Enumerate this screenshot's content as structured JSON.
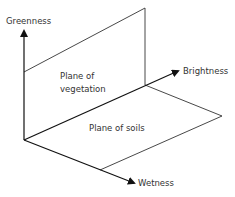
{
  "diagram": {
    "type": "tasseled-cap-3d-axes",
    "axes": {
      "greenness": "Greenness",
      "brightness": "Brightness",
      "wetness": "Wetness"
    },
    "planes": {
      "vegetation": [
        "Plane of",
        "vegetation"
      ],
      "soils": "Plane of soils"
    },
    "colors": {
      "line": "#333333",
      "axis": "#111111",
      "text": "#333333"
    }
  }
}
